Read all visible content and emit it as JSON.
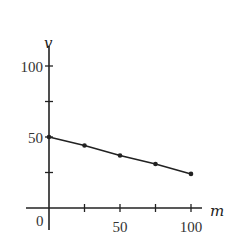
{
  "chart_data": {
    "type": "line",
    "title": "",
    "xlabel": "m",
    "ylabel": "v",
    "x": [
      0,
      25,
      50,
      75,
      100
    ],
    "series": [
      {
        "name": "v",
        "values": [
          50,
          44,
          37,
          31,
          24
        ]
      }
    ],
    "xlim": [
      0,
      110
    ],
    "ylim": [
      0,
      110
    ],
    "x_ticks": [
      25,
      50,
      75,
      100
    ],
    "x_tick_labels": [
      "",
      "50",
      "",
      "100"
    ],
    "y_ticks": [
      25,
      50,
      75,
      100
    ],
    "y_tick_labels": [
      "",
      "50",
      "",
      "100"
    ],
    "origin_label": "0",
    "grid": false,
    "legend": "none",
    "markers": true
  },
  "colors": {
    "line": "#222222",
    "axis": "#222222",
    "text": "#333333"
  }
}
